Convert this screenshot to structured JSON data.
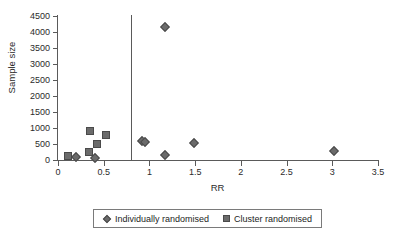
{
  "chart_data": {
    "type": "scatter",
    "title": "",
    "xlabel": "RR",
    "ylabel": "Sample size",
    "xlim": [
      0,
      3.5
    ],
    "ylim": [
      0,
      4500
    ],
    "xticks": [
      "0",
      "0.5",
      "1",
      "1.5",
      "2",
      "2.5",
      "3",
      "3.5"
    ],
    "xtick_values": [
      0,
      0.5,
      1,
      1.5,
      2,
      2.5,
      3,
      3.5
    ],
    "yticks": [
      "0",
      "500",
      "1000",
      "1500",
      "2000",
      "2500",
      "3000",
      "3500",
      "4000",
      "4500"
    ],
    "ytick_values": [
      0,
      500,
      1000,
      1500,
      2000,
      2500,
      3000,
      3500,
      4000,
      4500
    ],
    "grid": false,
    "legend_position": "bottom",
    "reference_line": {
      "axis": "vertical",
      "x": 0.8
    },
    "marker_color": "#6b6b6b",
    "axis_color": "#5a5a5a",
    "series": [
      {
        "name": "Individually randomised",
        "marker": "diamond",
        "points": [
          {
            "x": 0.2,
            "y": 90
          },
          {
            "x": 0.4,
            "y": 70
          },
          {
            "x": 0.92,
            "y": 600
          },
          {
            "x": 0.95,
            "y": 560
          },
          {
            "x": 1.17,
            "y": 4150
          },
          {
            "x": 1.17,
            "y": 150
          },
          {
            "x": 1.49,
            "y": 530
          },
          {
            "x": 3.02,
            "y": 290
          }
        ]
      },
      {
        "name": "Cluster randomised",
        "marker": "square",
        "points": [
          {
            "x": 0.11,
            "y": 140
          },
          {
            "x": 0.34,
            "y": 260
          },
          {
            "x": 0.35,
            "y": 900
          },
          {
            "x": 0.43,
            "y": 510
          },
          {
            "x": 0.52,
            "y": 770
          }
        ]
      }
    ]
  },
  "legend": {
    "entries": [
      {
        "label": "Individually randomised",
        "marker": "diamond"
      },
      {
        "label": "Cluster randomised",
        "marker": "square"
      }
    ]
  }
}
